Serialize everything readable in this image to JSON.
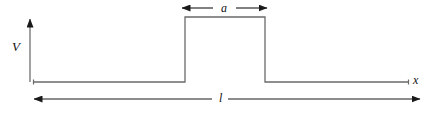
{
  "figure": {
    "kind": "potential-energy-diagram",
    "background_color": "#ffffff",
    "line_color": "#6a6a6a",
    "arrow_color": "#1a1a1a",
    "label_color": "#111111",
    "axes": {
      "vertical": {
        "label": "V",
        "arrow": "up",
        "x": 30,
        "top_y": 15,
        "bottom_y": 82
      },
      "horizontal": {
        "label": "x",
        "arrow": "none",
        "y": 82,
        "start_x": 33,
        "end_x": 409
      }
    },
    "barrier": {
      "left_x": 185,
      "right_x": 265,
      "top_y": 17,
      "base_y": 82
    },
    "dimensions": [
      {
        "label": "a",
        "position": "top",
        "arrow_style": "double-headed",
        "y": 8,
        "start_x": 181,
        "end_x": 268,
        "label_x": 221
      },
      {
        "label": "l",
        "position": "bottom",
        "arrow_style": "double-headed",
        "y": 99,
        "start_x": 33,
        "end_x": 421,
        "label_x": 219
      }
    ]
  }
}
